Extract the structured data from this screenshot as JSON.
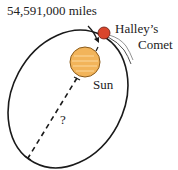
{
  "diagram": {
    "distance_label": "54,591,000 miles",
    "comet_label_line1": "Halley’s",
    "comet_label_line2": "Comet",
    "sun_label": "Sun",
    "unknown_label": "?",
    "colors": {
      "orbit": "#1a1a1a",
      "sun_fill": "#f2b45a",
      "sun_stroke": "#8a5a1a",
      "comet_fill": "#d9452b",
      "comet_stroke": "#6a1a10"
    }
  }
}
